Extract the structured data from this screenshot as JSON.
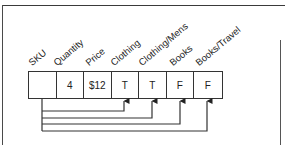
{
  "diagram": {
    "fields": [
      {
        "label": "SKU",
        "value": ""
      },
      {
        "label": "Quantity",
        "value": "4"
      },
      {
        "label": "Price",
        "value": "$12"
      },
      {
        "label": "Clothing",
        "value": "T"
      },
      {
        "label": "Clothing/Mens",
        "value": "T"
      },
      {
        "label": "Books",
        "value": "F"
      },
      {
        "label": "Books/Travel",
        "value": "F"
      }
    ],
    "links": [
      {
        "from": "SKU",
        "to": "Clothing"
      },
      {
        "from": "SKU",
        "to": "Clothing/Mens"
      },
      {
        "from": "SKU",
        "to": "Books"
      },
      {
        "from": "SKU",
        "to": "Books/Travel"
      }
    ],
    "colors": {
      "line": "#333333",
      "background": "#ffffff"
    }
  }
}
